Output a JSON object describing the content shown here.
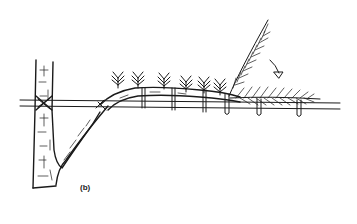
{
  "figure": {
    "panel_label": "(b)",
    "colors": {
      "ink": "#1a1a1a",
      "background": "#ffffff"
    },
    "elements": [
      "tree-trunk",
      "support-wire",
      "trained-branch",
      "branch-ties",
      "upright-shoots",
      "terminal-shoot-upright",
      "terminal-shoot-trained",
      "bend-arrow"
    ]
  }
}
